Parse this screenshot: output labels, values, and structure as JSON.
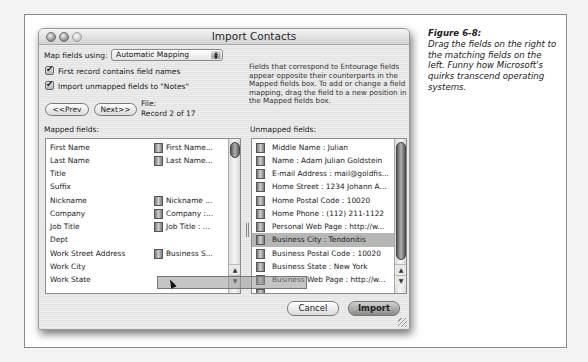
{
  "window": {
    "title": "Import Contacts",
    "map_fields_label": "Map fields using:",
    "map_fields_value": "Automatic Mapping",
    "checkboxes": [
      {
        "label": "First record contains field names",
        "checked": true
      },
      {
        "label": "Import unmapped fields to \"Notes\"",
        "checked": true
      }
    ],
    "prev_button": "<<Prev",
    "next_button": "Next>>",
    "file_label": "File:",
    "record_label": "Record 2 of 17",
    "description": "Fields that correspond to Entourage fields appear opposite their counterparts in the Mapped fields box. To add or change a field mapping, drag the field to a new position in the Mapped fields box.",
    "mapped_fields_label": "Mapped fields:",
    "unmapped_fields_label": "Unmapped fields:",
    "mapped_fields": [
      {
        "name": "First Name",
        "mapped": "First Name..."
      },
      {
        "name": "Last Name",
        "mapped": "Last Name..."
      },
      {
        "name": "Title",
        "mapped": ""
      },
      {
        "name": "Suffix",
        "mapped": ""
      },
      {
        "name": "Nickname",
        "mapped": "Nickname ..."
      },
      {
        "name": "Company",
        "mapped": "Company :..."
      },
      {
        "name": "Job Title",
        "mapped": "Job Title : ..."
      },
      {
        "name": "Dept",
        "mapped": ""
      },
      {
        "name": "Work Street Address",
        "mapped": "Business S..."
      },
      {
        "name": "Work City",
        "mapped": ""
      },
      {
        "name": "Work State",
        "mapped": ""
      }
    ],
    "unmapped_fields": [
      "Middle Name : Julian",
      "Name : Adam Julian Goldstein",
      "E-mail Address : mail@goldfis...",
      "Home Street : 1234 Johann A...",
      "Home Postal Code : 10020",
      "Home Phone : (112) 211-1122",
      "Personal Web Page : http://w...",
      "Business City : Tendonitis",
      "Business Postal Code : 10020",
      "Business State : New York",
      "Business Web Page : http://w..."
    ],
    "selected_unmapped_index": 7,
    "cancel_button": "Cancel",
    "import_button": "Import"
  },
  "caption": {
    "title": "Figure 6-8:",
    "text": "Drag the fields on the right to the matching fields on the left. Funny how Microsoft's quirks transcend operating systems."
  }
}
